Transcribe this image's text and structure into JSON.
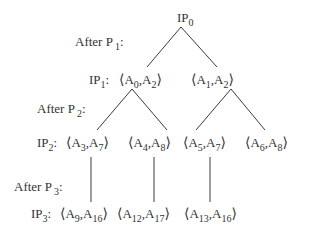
{
  "diagram": {
    "root": {
      "base": "IP",
      "sub": "0"
    },
    "steps": [
      {
        "text": "After P",
        "sub": "1",
        "suffix": ":"
      },
      {
        "text": "After P",
        "sub": "2",
        "suffix": ":"
      },
      {
        "text": "After P",
        "sub": "3",
        "suffix": ":"
      }
    ],
    "levels": [
      {
        "label": {
          "base": "IP",
          "sub": "1",
          "suffix": ":"
        }
      },
      {
        "label": {
          "base": "IP",
          "sub": "2",
          "suffix": ":"
        }
      },
      {
        "label": {
          "base": "IP",
          "sub": "3",
          "suffix": ":"
        }
      }
    ],
    "angle_open": "⟨",
    "angle_close": "⟩",
    "comma": ",",
    "letter": "A",
    "nodes": {
      "l1": [
        {
          "a": "0",
          "b": "2"
        },
        {
          "a": "1",
          "b": "2"
        }
      ],
      "l2": [
        {
          "a": "3",
          "b": "7"
        },
        {
          "a": "4",
          "b": "8"
        },
        {
          "a": "5",
          "b": "7"
        },
        {
          "a": "6",
          "b": "8"
        }
      ],
      "l3": [
        {
          "a": "9",
          "b": "16"
        },
        {
          "a": "12",
          "b": "17"
        },
        {
          "a": "13",
          "b": "16"
        }
      ]
    }
  }
}
